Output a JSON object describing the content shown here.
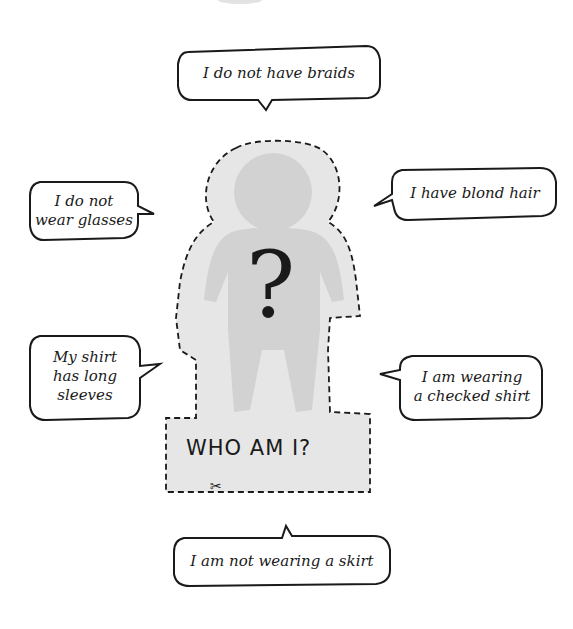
{
  "figure": {
    "title": "WHO AM I?",
    "question_mark": "?",
    "scissors_icon": "✂",
    "colors": {
      "background": "#ffffff",
      "cutout_outer": "#e6e6e6",
      "figure_silhouette": "#d2d2d2",
      "ink": "#1a1a1a"
    }
  },
  "bubbles": [
    {
      "id": "top",
      "lines": [
        "I do not have braids"
      ]
    },
    {
      "id": "left-upper",
      "lines": [
        "I do not",
        "wear glasses"
      ]
    },
    {
      "id": "right-upper",
      "lines": [
        "I have blond hair"
      ]
    },
    {
      "id": "left-lower",
      "lines": [
        "My shirt",
        "has long",
        "sleeves"
      ]
    },
    {
      "id": "right-lower",
      "lines": [
        "I am wearing",
        "a checked shirt"
      ]
    },
    {
      "id": "bottom",
      "lines": [
        "I am not wearing a skirt"
      ]
    }
  ]
}
